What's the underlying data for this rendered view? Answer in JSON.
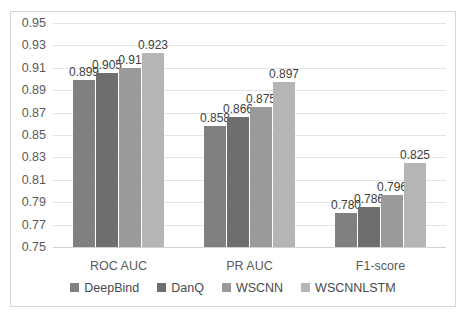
{
  "chart_data": {
    "type": "bar",
    "title": "",
    "subtitle": "",
    "xlabel": "",
    "ylabel": "",
    "categories": [
      "ROC AUC",
      "PR AUC",
      "F1-score"
    ],
    "series": [
      {
        "name": "DeepBind",
        "color": "#808080",
        "values": [
          0.899,
          0.858,
          0.78
        ],
        "labels": [
          "0.899",
          "0.858",
          "0.780"
        ]
      },
      {
        "name": "DanQ",
        "color": "#6e6e6e",
        "values": [
          0.905,
          0.866,
          0.786
        ],
        "labels": [
          "0.905",
          "0.866",
          "0.786"
        ]
      },
      {
        "name": "WSCNN",
        "color": "#9a9a9a",
        "values": [
          0.91,
          0.875,
          0.796
        ],
        "labels": [
          "0.91",
          "0.875",
          "0.796"
        ]
      },
      {
        "name": "WSCNNLSTM",
        "color": "#b5b5b5",
        "values": [
          0.923,
          0.897,
          0.825
        ],
        "labels": [
          "0.923",
          "0.897",
          "0.825"
        ]
      }
    ],
    "ylim": [
      0.75,
      0.95
    ],
    "ytick_step": 0.02,
    "yticks": [
      "0.95",
      "0.93",
      "0.91",
      "0.89",
      "0.87",
      "0.85",
      "0.83",
      "0.81",
      "0.79",
      "0.77",
      "0.75"
    ],
    "grid": true,
    "grid_axis": "y",
    "legend_position": "bottom",
    "border": true
  }
}
